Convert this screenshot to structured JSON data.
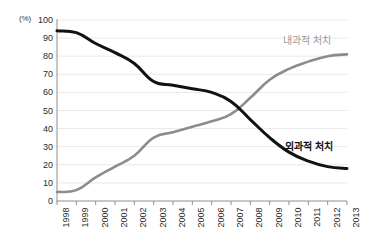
{
  "chart_data": {
    "type": "line",
    "title": "",
    "xlabel": "",
    "ylabel": "(%)",
    "y_unit": "(%)",
    "categories": [
      "1998",
      "1999",
      "2000",
      "2001",
      "2002",
      "2003",
      "2004",
      "2005",
      "2006",
      "2007",
      "2008",
      "2009",
      "2010",
      "2011",
      "2012",
      "2013"
    ],
    "x": [
      1998,
      1999,
      2000,
      2001,
      2002,
      2003,
      2004,
      2005,
      2006,
      2007,
      2008,
      2009,
      2010,
      2011,
      2012,
      2013
    ],
    "ylim": [
      0,
      100
    ],
    "ytick_step": 10,
    "yticks": [
      100,
      90,
      80,
      70,
      60,
      50,
      40,
      30,
      20,
      10,
      0
    ],
    "grid": "horizontal",
    "legend_position": "inline-right",
    "series": [
      {
        "name": "외과적 처치",
        "label": "외과적 처치",
        "color": "#111111",
        "values": [
          94,
          93,
          87,
          82,
          76,
          66,
          64,
          62,
          60,
          55,
          45,
          35,
          27,
          22,
          19,
          18
        ]
      },
      {
        "name": "내과적 처치",
        "label": "내과적 처치",
        "color": "#8c8c8c",
        "values": [
          5,
          6,
          13,
          19,
          25,
          35,
          38,
          41,
          44,
          48,
          57,
          67,
          73,
          77,
          80,
          81
        ]
      }
    ]
  },
  "axis": {
    "y_unit_caption": "(%)",
    "y_labels": [
      "100",
      "90",
      "80",
      "70",
      "60",
      "50",
      "40",
      "30",
      "20",
      "10",
      "0"
    ],
    "x_labels": [
      "1998",
      "1999",
      "2000",
      "2001",
      "2002",
      "2003",
      "2004",
      "2005",
      "2006",
      "2007",
      "2008",
      "2009",
      "2010",
      "2011",
      "2012",
      "2013"
    ]
  },
  "legend": {
    "medical_label": "내과적 처치",
    "surgical_label": "외과적 처치"
  },
  "colors": {
    "surgical_line": "#111111",
    "medical_line": "#8c8c8c",
    "grid": "#e9e9e9",
    "axis": "#8f8f8f",
    "background": "#ffffff"
  }
}
